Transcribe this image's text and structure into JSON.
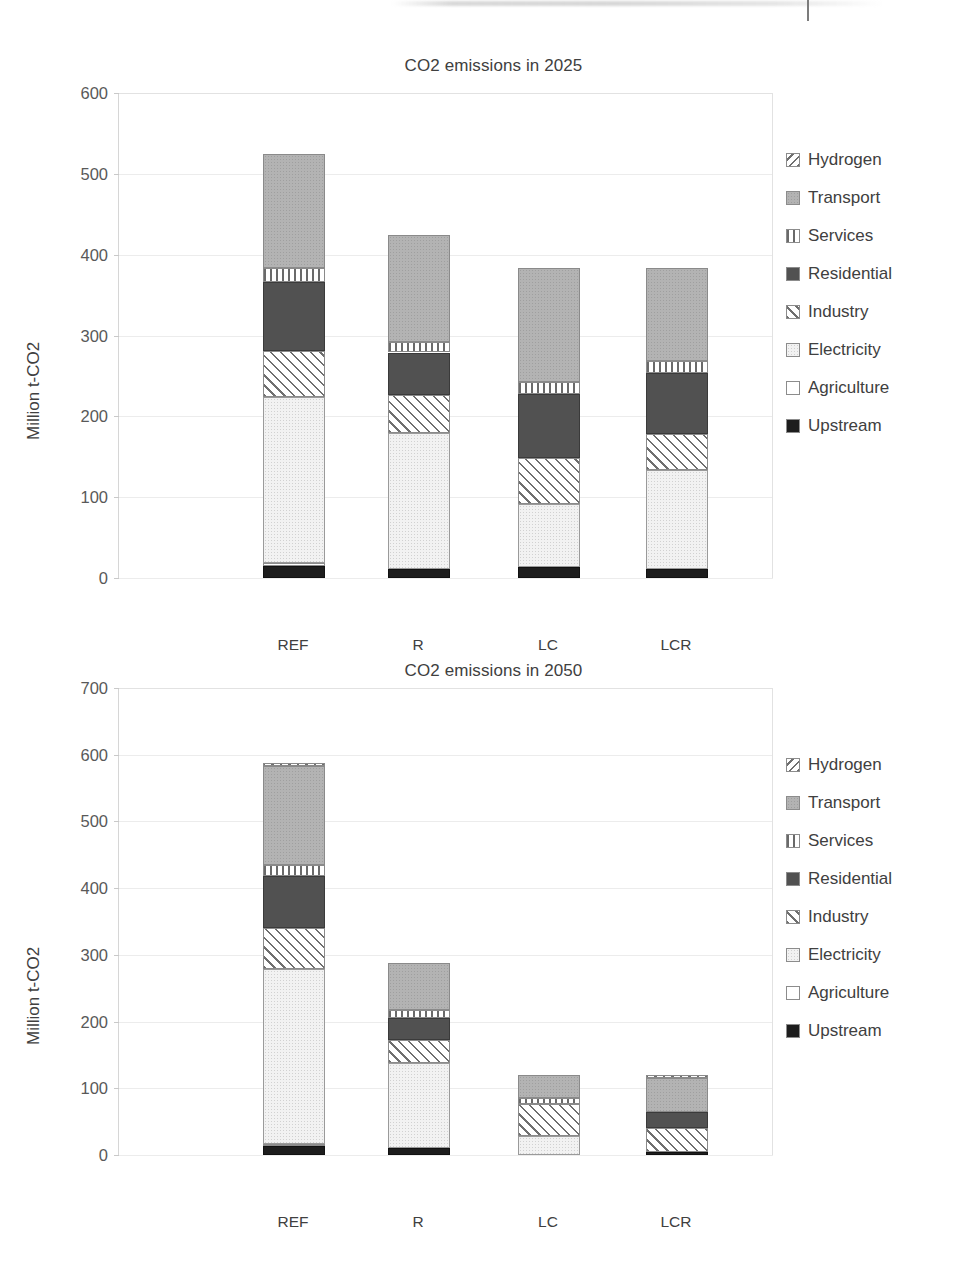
{
  "page": {
    "background": "#ffffff",
    "top_artifact": "scan-edge-rule"
  },
  "series_styles": {
    "Upstream": "#1d1d1d",
    "Agriculture": "#ffffff",
    "Electricity": "#f2f2f2",
    "Industry": "hatch-forward-slash",
    "Residential": "#515151",
    "Services": "hatch-vertical-stripes",
    "Transport": "#b3b3b3",
    "Hydrogen": "hatch-back-slash"
  },
  "legend": {
    "items": [
      {
        "label": "Hydrogen",
        "swatch": "hatch-back-slash"
      },
      {
        "label": "Transport",
        "swatch": "#b3b3b3"
      },
      {
        "label": "Services",
        "swatch": "hatch-vertical-stripes"
      },
      {
        "label": "Residential",
        "swatch": "#515151"
      },
      {
        "label": "Industry",
        "swatch": "hatch-forward-slash"
      },
      {
        "label": "Electricity",
        "swatch": "#f2f2f2"
      },
      {
        "label": "Agriculture",
        "swatch": "#ffffff"
      },
      {
        "label": "Upstream",
        "swatch": "#1d1d1d"
      }
    ]
  },
  "chart_data": [
    {
      "id": "co2-2025",
      "type": "bar",
      "stacked": true,
      "title": "CO2 emissions in 2025",
      "xlabel": "",
      "ylabel": "Million t-CO2",
      "ylim": [
        0,
        600
      ],
      "ytick_step": 100,
      "yticks": [
        0,
        100,
        200,
        300,
        400,
        500,
        600
      ],
      "grid": true,
      "legend_position": "right",
      "categories": [
        "REF",
        "R",
        "LC",
        "LCR"
      ],
      "stack_order": [
        "Upstream",
        "Agriculture",
        "Electricity",
        "Industry",
        "Residential",
        "Services",
        "Transport",
        "Hydrogen"
      ],
      "series": [
        {
          "name": "Upstream",
          "values": [
            15,
            11,
            14,
            11
          ]
        },
        {
          "name": "Agriculture",
          "values": [
            4,
            0,
            0,
            0
          ]
        },
        {
          "name": "Electricity",
          "values": [
            205,
            168,
            78,
            123
          ]
        },
        {
          "name": "Industry",
          "values": [
            57,
            47,
            56,
            44
          ]
        },
        {
          "name": "Residential",
          "values": [
            85,
            53,
            80,
            76
          ]
        },
        {
          "name": "Services",
          "values": [
            17,
            13,
            15,
            14
          ]
        },
        {
          "name": "Transport",
          "values": [
            142,
            132,
            141,
            116
          ]
        },
        {
          "name": "Hydrogen",
          "values": [
            0,
            0,
            0,
            0
          ]
        }
      ],
      "totals": [
        525,
        424,
        384,
        384
      ]
    },
    {
      "id": "co2-2050",
      "type": "bar",
      "stacked": true,
      "title": "CO2 emissions in 2050",
      "xlabel": "",
      "ylabel": "Million t-CO2",
      "ylim": [
        0,
        700
      ],
      "ytick_step": 100,
      "yticks": [
        0,
        100,
        200,
        300,
        400,
        500,
        600,
        700
      ],
      "grid": true,
      "legend_position": "right",
      "categories": [
        "REF",
        "R",
        "LC",
        "LCR"
      ],
      "stack_order": [
        "Upstream",
        "Agriculture",
        "Electricity",
        "Industry",
        "Residential",
        "Services",
        "Transport",
        "Hydrogen"
      ],
      "series": [
        {
          "name": "Upstream",
          "values": [
            13,
            10,
            0,
            5
          ]
        },
        {
          "name": "Agriculture",
          "values": [
            3,
            0,
            0,
            0
          ]
        },
        {
          "name": "Electricity",
          "values": [
            263,
            128,
            28,
            0
          ]
        },
        {
          "name": "Industry",
          "values": [
            62,
            35,
            48,
            35
          ]
        },
        {
          "name": "Residential",
          "values": [
            77,
            33,
            0,
            25
          ]
        },
        {
          "name": "Services",
          "values": [
            17,
            12,
            10,
            0
          ]
        },
        {
          "name": "Transport",
          "values": [
            148,
            70,
            34,
            50
          ]
        },
        {
          "name": "Hydrogen",
          "values": [
            5,
            0,
            0,
            5
          ]
        }
      ],
      "totals": [
        583,
        288,
        120,
        120
      ]
    }
  ]
}
